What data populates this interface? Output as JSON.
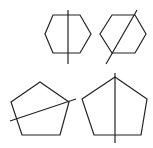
{
  "diagram": {
    "stroke_color": "#222222",
    "background": "#ffffff",
    "shapes": [
      {
        "id": "hexagon-1",
        "type": "hexagon",
        "points": "45,34 53,15 80,15 91,34 80,53 53,53",
        "line": {
          "x1": 68,
          "y1": 10,
          "x2": 68,
          "y2": 64,
          "orientation": "vertical"
        }
      },
      {
        "id": "hexagon-2",
        "type": "hexagon",
        "points": "100,34 112,15 135,15 146,34 135,53 112,53",
        "line": {
          "x1": 137,
          "y1": 10,
          "x2": 106,
          "y2": 64,
          "orientation": "diagonal"
        }
      },
      {
        "id": "pentagon-1",
        "type": "pentagon",
        "points": "40,82 69,102 60,135 22,135 11,102",
        "line": {
          "x1": 10,
          "y1": 121,
          "x2": 76,
          "y2": 99,
          "orientation": "diagonal"
        }
      },
      {
        "id": "pentagon-2",
        "type": "pentagon",
        "points": "115,77 147,99 141,135 94,135 82,99",
        "line": {
          "x1": 115,
          "y1": 73,
          "x2": 115,
          "y2": 143,
          "orientation": "vertical"
        }
      }
    ]
  }
}
